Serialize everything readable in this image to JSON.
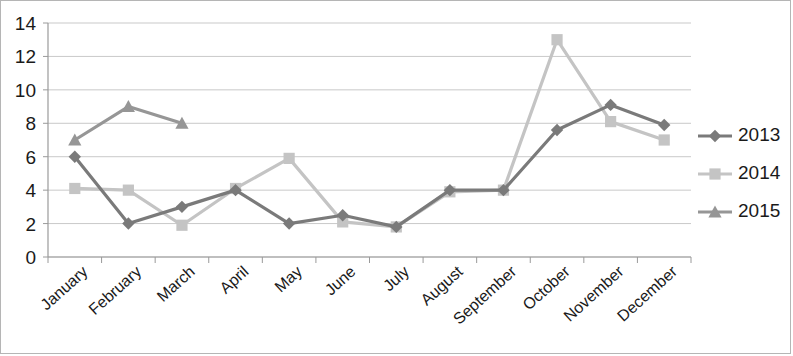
{
  "chart_data": {
    "type": "line",
    "title": "",
    "xlabel": "",
    "ylabel": "",
    "ylim": [
      0,
      14
    ],
    "ytick_step": 2,
    "yticks": [
      "0",
      "2",
      "4",
      "6",
      "8",
      "10",
      "12",
      "14"
    ],
    "grid": true,
    "legend_position": "right",
    "categories": [
      "January",
      "February",
      "March",
      "April",
      "May",
      "June",
      "July",
      "August",
      "September",
      "October",
      "November",
      "December"
    ],
    "series": [
      {
        "name": "2013",
        "color": "#7a7a7a",
        "marker": "diamond",
        "values": [
          6,
          2,
          3,
          4,
          2,
          2.5,
          1.8,
          4,
          4,
          7.6,
          9.1,
          7.9
        ]
      },
      {
        "name": "2014",
        "color": "#c4c4c4",
        "marker": "square",
        "values": [
          4.1,
          4,
          1.9,
          4.1,
          5.9,
          2.1,
          1.8,
          3.9,
          4,
          13,
          8.1,
          7
        ]
      },
      {
        "name": "2015",
        "color": "#969696",
        "marker": "triangle",
        "values": [
          7,
          9,
          8,
          null,
          null,
          null,
          null,
          null,
          null,
          null,
          null,
          null
        ]
      }
    ]
  },
  "legend": {
    "entries": [
      {
        "label": "2013"
      },
      {
        "label": "2014"
      },
      {
        "label": "2015"
      }
    ]
  }
}
